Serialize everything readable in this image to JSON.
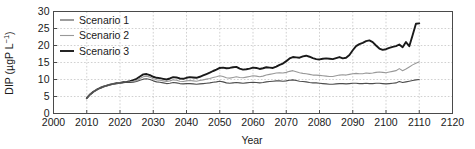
{
  "chart_data": {
    "type": "line",
    "title": "",
    "xlabel": "Year",
    "ylabel": "DIP (µgP L⁻¹)",
    "ylabel_base": "DIP (µgP L",
    "ylabel_sup": "−1",
    "ylabel_close": ")",
    "xlim": [
      2000,
      2120
    ],
    "ylim": [
      0,
      30
    ],
    "xticks": [
      2000,
      2010,
      2020,
      2030,
      2040,
      2050,
      2060,
      2070,
      2080,
      2090,
      2100,
      2110,
      2120
    ],
    "yticks": [
      0,
      5,
      10,
      15,
      20,
      25,
      30
    ],
    "grid": true,
    "grid_style": "dashed",
    "legend_position": "top-left",
    "x": [
      2010,
      2011,
      2012,
      2013,
      2014,
      2015,
      2016,
      2017,
      2018,
      2019,
      2020,
      2021,
      2022,
      2023,
      2024,
      2025,
      2026,
      2027,
      2028,
      2029,
      2030,
      2031,
      2032,
      2033,
      2034,
      2035,
      2036,
      2037,
      2038,
      2039,
      2040,
      2041,
      2042,
      2043,
      2044,
      2045,
      2046,
      2047,
      2048,
      2049,
      2050,
      2051,
      2052,
      2053,
      2054,
      2055,
      2056,
      2057,
      2058,
      2059,
      2060,
      2061,
      2062,
      2063,
      2064,
      2065,
      2066,
      2067,
      2068,
      2069,
      2070,
      2071,
      2072,
      2073,
      2074,
      2075,
      2076,
      2077,
      2078,
      2079,
      2080,
      2081,
      2082,
      2083,
      2084,
      2085,
      2086,
      2087,
      2088,
      2089,
      2090,
      2091,
      2092,
      2093,
      2094,
      2095,
      2096,
      2097,
      2098,
      2099,
      2100,
      2101,
      2102,
      2103,
      2104,
      2105,
      2106,
      2107,
      2108,
      2109,
      2110
    ],
    "series": [
      {
        "name": "Scenario 1",
        "color": "#4d4d4d",
        "width": 1.1,
        "values": [
          4.5,
          5.6,
          6.4,
          7.0,
          7.5,
          7.9,
          8.2,
          8.5,
          8.7,
          8.9,
          9.0,
          9.1,
          9.1,
          9.1,
          9.2,
          9.4,
          9.8,
          10.1,
          10.2,
          10.0,
          9.6,
          9.3,
          9.2,
          9.0,
          8.8,
          8.9,
          9.1,
          9.0,
          8.8,
          8.7,
          8.8,
          8.8,
          8.7,
          8.6,
          8.7,
          8.8,
          8.9,
          9.0,
          9.2,
          9.3,
          9.5,
          9.3,
          9.0,
          8.9,
          9.0,
          9.1,
          9.0,
          8.9,
          9.0,
          9.1,
          9.2,
          9.1,
          9.0,
          9.1,
          9.3,
          9.4,
          9.5,
          9.6,
          9.6,
          9.5,
          9.6,
          9.8,
          9.9,
          9.7,
          9.5,
          9.4,
          9.3,
          9.1,
          9.0,
          9.0,
          8.9,
          8.8,
          8.7,
          8.6,
          8.6,
          8.7,
          8.8,
          8.8,
          8.7,
          8.8,
          8.9,
          8.9,
          8.8,
          8.8,
          8.9,
          8.8,
          8.8,
          8.9,
          8.9,
          8.8,
          8.7,
          8.8,
          8.9,
          9.0,
          9.4,
          9.1,
          9.3,
          9.5,
          9.7,
          9.9,
          10.0
        ]
      },
      {
        "name": "Scenario 2",
        "color": "#999999",
        "width": 1.1,
        "values": [
          4.5,
          5.6,
          6.4,
          7.0,
          7.5,
          7.9,
          8.2,
          8.5,
          8.7,
          8.9,
          9.0,
          9.1,
          9.2,
          9.3,
          9.5,
          9.8,
          10.3,
          10.8,
          11.0,
          10.7,
          10.2,
          9.9,
          9.8,
          9.6,
          9.4,
          9.6,
          9.9,
          9.8,
          9.5,
          9.4,
          9.6,
          9.7,
          9.6,
          9.5,
          9.7,
          9.9,
          10.1,
          10.3,
          10.6,
          10.8,
          11.1,
          10.9,
          10.5,
          10.4,
          10.6,
          10.8,
          10.6,
          10.5,
          10.7,
          10.9,
          11.1,
          11.0,
          10.8,
          11.0,
          11.3,
          11.5,
          11.7,
          11.9,
          12.0,
          11.9,
          12.1,
          12.4,
          12.6,
          12.3,
          12.0,
          11.8,
          11.7,
          11.5,
          11.3,
          11.3,
          11.2,
          11.1,
          11.0,
          10.9,
          10.9,
          11.1,
          11.3,
          11.4,
          11.3,
          11.5,
          11.7,
          11.8,
          11.7,
          11.7,
          11.9,
          11.8,
          11.9,
          12.1,
          12.2,
          12.1,
          12.0,
          12.2,
          12.4,
          12.6,
          13.2,
          12.6,
          13.1,
          13.7,
          14.3,
          14.8,
          15.2
        ]
      },
      {
        "name": "Scenario 3",
        "color": "#1a1a1a",
        "width": 1.9,
        "values": [
          4.5,
          5.6,
          6.4,
          7.0,
          7.5,
          7.9,
          8.2,
          8.5,
          8.7,
          8.9,
          9.0,
          9.2,
          9.3,
          9.5,
          9.8,
          10.2,
          10.9,
          11.5,
          11.6,
          11.3,
          10.8,
          10.5,
          10.4,
          10.2,
          10.0,
          10.3,
          10.7,
          10.6,
          10.3,
          10.2,
          10.5,
          10.7,
          10.6,
          10.5,
          10.8,
          11.2,
          11.6,
          12.0,
          12.5,
          12.9,
          13.4,
          13.5,
          13.3,
          13.4,
          13.6,
          13.7,
          13.2,
          12.9,
          13.0,
          13.2,
          13.5,
          13.4,
          13.1,
          13.3,
          13.6,
          13.5,
          13.4,
          13.8,
          14.3,
          14.7,
          15.4,
          16.2,
          16.6,
          16.5,
          16.4,
          16.8,
          17.0,
          16.7,
          16.3,
          16.0,
          15.9,
          16.1,
          16.2,
          16.1,
          16.0,
          16.3,
          16.6,
          16.2,
          16.4,
          17.2,
          18.6,
          19.8,
          20.4,
          20.8,
          21.3,
          21.5,
          21.0,
          20.0,
          19.1,
          18.7,
          18.9,
          19.3,
          19.6,
          19.8,
          20.3,
          19.5,
          21.0,
          19.8,
          23.0,
          26.4,
          26.5
        ]
      }
    ]
  },
  "legend": {
    "items": [
      {
        "label": "Scenario 1"
      },
      {
        "label": "Scenario 2"
      },
      {
        "label": "Scenario 3"
      }
    ]
  },
  "axes": {
    "x_title": "Year",
    "y_title": "DIP (µgP L⁻¹)",
    "x_tick_labels": [
      "2000",
      "2010",
      "2020",
      "2030",
      "2040",
      "2050",
      "2060",
      "2070",
      "2080",
      "2090",
      "2100",
      "2110",
      "2120"
    ],
    "y_tick_labels": [
      "0",
      "5",
      "10",
      "15",
      "20",
      "25",
      "30"
    ]
  },
  "style": {
    "background": "#ffffff",
    "axis_color": "#4a4a4a",
    "grid_color": "#bdbdbd",
    "text_color": "#1a1a1a"
  }
}
